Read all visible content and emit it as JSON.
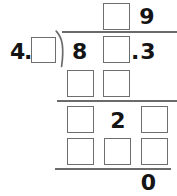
{
  "problem": {
    "type": "long-division-worksheet",
    "divisor": {
      "whole_digit": "4",
      "decimal_point": ".",
      "blank_label": ""
    },
    "dividend": {
      "first_digit": "8",
      "blank_label": "",
      "decimal_point": ".",
      "last_digit": "3"
    },
    "quotient": {
      "blank_label": "",
      "digit": "9"
    },
    "rows": [
      {
        "name": "first-subtraction-row",
        "cells": [
          {
            "kind": "blank",
            "value": ""
          },
          {
            "kind": "blank",
            "value": ""
          }
        ]
      },
      {
        "name": "second-bring-down-row",
        "cells": [
          {
            "kind": "blank",
            "value": ""
          },
          {
            "kind": "digit",
            "value": "2"
          },
          {
            "kind": "blank",
            "value": ""
          }
        ]
      },
      {
        "name": "second-subtraction-row",
        "cells": [
          {
            "kind": "blank",
            "value": ""
          },
          {
            "kind": "blank",
            "value": ""
          },
          {
            "kind": "blank",
            "value": ""
          }
        ]
      }
    ],
    "remainder": "0",
    "colors": {
      "ink": "#141414",
      "box_border": "#6e6e6e",
      "rule": "#6b6b6b",
      "page": "#ffffff"
    }
  }
}
